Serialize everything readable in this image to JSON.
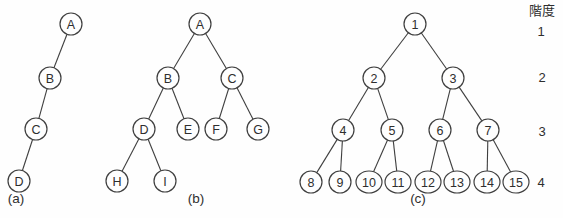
{
  "figure": {
    "background": "#fefefe",
    "stroke_color": "#3f3f3f",
    "text_color": "#2e2e2e",
    "node_radius": 11,
    "node_radius_wide": 13
  },
  "legend": {
    "title": "階度",
    "title_x": 542,
    "title_y": 15,
    "levels": [
      {
        "label": "1",
        "x": 541,
        "y": 31
      },
      {
        "label": "2",
        "x": 542,
        "y": 77
      },
      {
        "label": "3",
        "x": 542,
        "y": 131
      },
      {
        "label": "4",
        "x": 541,
        "y": 182
      }
    ]
  },
  "trees": [
    {
      "id": "a",
      "caption": "(a)",
      "caption_x": 16,
      "caption_y": 203,
      "nodes": [
        {
          "label": "A",
          "x": 71,
          "y": 24
        },
        {
          "label": "B",
          "x": 50,
          "y": 78
        },
        {
          "label": "C",
          "x": 36,
          "y": 129
        },
        {
          "label": "D",
          "x": 19,
          "y": 181
        }
      ],
      "edges": [
        [
          "A",
          "B"
        ],
        [
          "B",
          "C"
        ],
        [
          "C",
          "D"
        ]
      ]
    },
    {
      "id": "b",
      "caption": "(b)",
      "caption_x": 196,
      "caption_y": 203,
      "nodes": [
        {
          "label": "A",
          "x": 200,
          "y": 24
        },
        {
          "label": "B",
          "x": 168,
          "y": 78
        },
        {
          "label": "C",
          "x": 232,
          "y": 78
        },
        {
          "label": "D",
          "x": 144,
          "y": 129
        },
        {
          "label": "E",
          "x": 188,
          "y": 129
        },
        {
          "label": "F",
          "x": 216,
          "y": 129
        },
        {
          "label": "G",
          "x": 258,
          "y": 129
        },
        {
          "label": "H",
          "x": 117,
          "y": 181
        },
        {
          "label": "I",
          "x": 165,
          "y": 181
        }
      ],
      "edges": [
        [
          "A",
          "B"
        ],
        [
          "A",
          "C"
        ],
        [
          "B",
          "D"
        ],
        [
          "B",
          "E"
        ],
        [
          "C",
          "F"
        ],
        [
          "C",
          "G"
        ],
        [
          "D",
          "H"
        ],
        [
          "D",
          "I"
        ]
      ]
    },
    {
      "id": "c",
      "caption": "(c)",
      "caption_x": 418,
      "caption_y": 203,
      "nodes": [
        {
          "label": "1",
          "x": 415,
          "y": 24
        },
        {
          "label": "2",
          "x": 374,
          "y": 78
        },
        {
          "label": "3",
          "x": 453,
          "y": 78
        },
        {
          "label": "4",
          "x": 343,
          "y": 130
        },
        {
          "label": "5",
          "x": 392,
          "y": 130
        },
        {
          "label": "6",
          "x": 440,
          "y": 130
        },
        {
          "label": "7",
          "x": 488,
          "y": 130
        },
        {
          "label": "8",
          "x": 311,
          "y": 182
        },
        {
          "label": "9",
          "x": 340,
          "y": 182
        },
        {
          "label": "10",
          "x": 369,
          "y": 182
        },
        {
          "label": "11",
          "x": 398,
          "y": 182
        },
        {
          "label": "12",
          "x": 428,
          "y": 182
        },
        {
          "label": "13",
          "x": 457,
          "y": 182
        },
        {
          "label": "14",
          "x": 487,
          "y": 182
        },
        {
          "label": "15",
          "x": 516,
          "y": 182
        }
      ],
      "edges": [
        [
          "1",
          "2"
        ],
        [
          "1",
          "3"
        ],
        [
          "2",
          "4"
        ],
        [
          "2",
          "5"
        ],
        [
          "3",
          "6"
        ],
        [
          "3",
          "7"
        ],
        [
          "4",
          "8"
        ],
        [
          "4",
          "9"
        ],
        [
          "5",
          "10"
        ],
        [
          "5",
          "11"
        ],
        [
          "6",
          "12"
        ],
        [
          "6",
          "13"
        ],
        [
          "7",
          "14"
        ],
        [
          "7",
          "15"
        ]
      ]
    }
  ]
}
